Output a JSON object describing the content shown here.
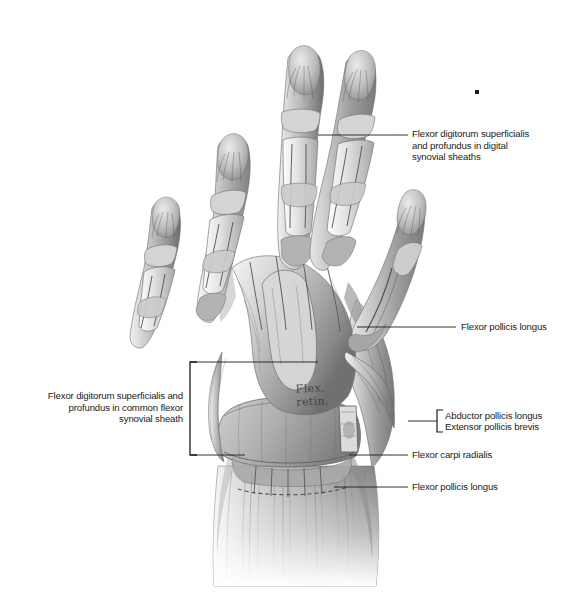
{
  "figure": {
    "background_color": "#ffffff",
    "ink_color": "#1b1b1b",
    "overlay_note": "Flex.\nretin."
  },
  "labels": {
    "flexor_digitorum_digital": {
      "text": "Flexor digitorum superficialis\nand profundus in digital\nsynovial sheaths",
      "align": "left"
    },
    "flexor_pollicis_longus_upper": {
      "text": "Flexor pollicis longus",
      "align": "left"
    },
    "flexor_digitorum_common": {
      "text": "Flexor digitorum superficialis and\nprofundus in common flexor\nsynovial sheath",
      "align": "right"
    },
    "abductor_pollicis_longus": {
      "text": "Abductor pollicis longus",
      "align": "left"
    },
    "extensor_pollicis_brevis": {
      "text": "Extensor pollicis brevis",
      "align": "left"
    },
    "flexor_carpi_radialis": {
      "text": "Flexor carpi radialis",
      "align": "left"
    },
    "flexor_pollicis_longus_lower": {
      "text": "Flexor pollicis longus",
      "align": "left"
    }
  }
}
